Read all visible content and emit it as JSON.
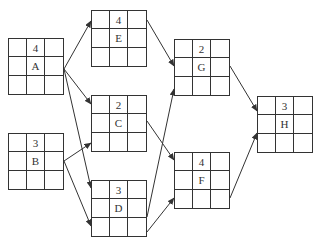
{
  "diagram": {
    "type": "activity-on-node network",
    "nodes": [
      {
        "id": "A",
        "label": "A",
        "duration": "4",
        "x": 8,
        "y": 38
      },
      {
        "id": "B",
        "label": "B",
        "duration": "3",
        "x": 8,
        "y": 133
      },
      {
        "id": "E",
        "label": "E",
        "duration": "4",
        "x": 91,
        "y": 10
      },
      {
        "id": "C",
        "label": "C",
        "duration": "2",
        "x": 91,
        "y": 95
      },
      {
        "id": "D",
        "label": "D",
        "duration": "3",
        "x": 91,
        "y": 180
      },
      {
        "id": "G",
        "label": "G",
        "duration": "2",
        "x": 174,
        "y": 39
      },
      {
        "id": "F",
        "label": "F",
        "duration": "4",
        "x": 174,
        "y": 152
      },
      {
        "id": "H",
        "label": "H",
        "duration": "3",
        "x": 257,
        "y": 96
      }
    ],
    "edges": [
      {
        "from": "A",
        "to": "E",
        "x1": 64,
        "y1": 69,
        "x2": 91,
        "y2": 21
      },
      {
        "from": "A",
        "to": "C",
        "x1": 64,
        "y1": 69,
        "x2": 91,
        "y2": 104
      },
      {
        "from": "A",
        "to": "D",
        "x1": 64,
        "y1": 69,
        "x2": 91,
        "y2": 188
      },
      {
        "from": "B",
        "to": "C",
        "x1": 64,
        "y1": 161,
        "x2": 91,
        "y2": 143
      },
      {
        "from": "B",
        "to": "D",
        "x1": 64,
        "y1": 161,
        "x2": 91,
        "y2": 226
      },
      {
        "from": "E",
        "to": "G",
        "x1": 147,
        "y1": 20,
        "x2": 174,
        "y2": 66
      },
      {
        "from": "D",
        "to": "G",
        "x1": 147,
        "y1": 217,
        "x2": 174,
        "y2": 89
      },
      {
        "from": "C",
        "to": "F",
        "x1": 147,
        "y1": 121,
        "x2": 174,
        "y2": 160
      },
      {
        "from": "D",
        "to": "F",
        "x1": 147,
        "y1": 232,
        "x2": 174,
        "y2": 198
      },
      {
        "from": "G",
        "to": "H",
        "x1": 230,
        "y1": 66,
        "x2": 257,
        "y2": 111
      },
      {
        "from": "F",
        "to": "H",
        "x1": 230,
        "y1": 198,
        "x2": 257,
        "y2": 133
      }
    ],
    "colors": {
      "line": "#333333",
      "background": "#ffffff"
    }
  }
}
